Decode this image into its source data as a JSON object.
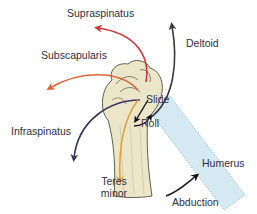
{
  "diagram": {
    "labels": {
      "supraspinatus": "Supraspinatus",
      "subscapularis": "Subscapularis",
      "deltoid": "Deltoid",
      "infraspinatus": "Infraspinatus",
      "teres_minor_line1": "Teres",
      "teres_minor_line2": "minor",
      "slide": "Slide",
      "roll": "Roll",
      "humerus": "Humerus",
      "abduction": "Abduction"
    },
    "colors": {
      "supraspinatus": "#d0353b",
      "subscapularis": "#d9673a",
      "deltoid": "#3a3a44",
      "infraspinatus": "#34365e",
      "teres_minor": "#d9a444",
      "slide_arrow": "#111111",
      "roll_arrow": "#1a1a2a",
      "abduction_arrow": "#1a1a2a",
      "bone_fill": "#ece6c8",
      "bone_outline": "#3a3a30",
      "humerus_ghost": "#d4e9f2",
      "label_text": "#2e2e48"
    }
  }
}
